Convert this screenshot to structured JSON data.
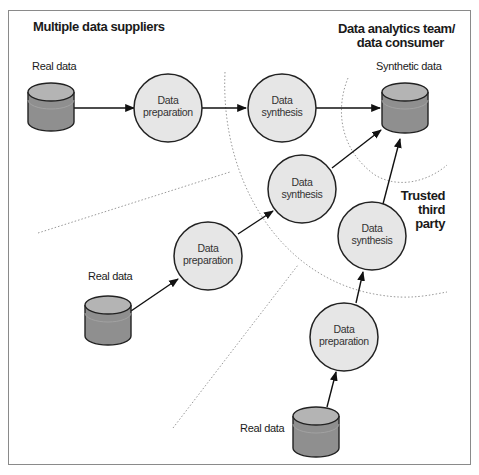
{
  "diagram": {
    "title_left": "Multiple data suppliers",
    "title_right_line1": "Data analytics team/",
    "title_right_line2": "data consumer",
    "trusted_line1": "Trusted",
    "trusted_line2": "third",
    "trusted_line3": "party",
    "synthetic_data_label": "Synthetic data",
    "sources": [
      {
        "label": "Real data"
      },
      {
        "label": "Real data"
      },
      {
        "label": "Real data"
      }
    ],
    "nodes": {
      "prep_top": {
        "line1": "Data",
        "line2": "preparation"
      },
      "synth_top": {
        "line1": "Data",
        "line2": "synthesis"
      },
      "prep_mid": {
        "line1": "Data",
        "line2": "preparation"
      },
      "synth_mid": {
        "line1": "Data",
        "line2": "synthesis"
      },
      "synth_right": {
        "line1": "Data",
        "line2": "synthesis"
      },
      "prep_bottom": {
        "line1": "Data",
        "line2": "preparation"
      }
    },
    "colors": {
      "node_fill": "#e6e6e6",
      "node_stroke": "#222222",
      "cyl_top": "#b4b4b4",
      "cyl_body": "#8f8f8f",
      "dotted": "#999999"
    }
  }
}
